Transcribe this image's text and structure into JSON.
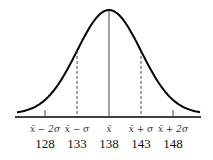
{
  "chart_data": {
    "type": "line",
    "title": "",
    "xlabel": "",
    "ylabel": "",
    "mean": 138,
    "sigma": 5,
    "x": [
      123,
      128,
      133,
      138,
      143,
      148,
      153
    ],
    "tick_symbols": [
      "x̄ − 2σ",
      "x̄ − σ",
      "x̄",
      "x̄ + σ",
      "x̄ + 2σ"
    ],
    "tick_values": [
      "128",
      "133",
      "138",
      "143",
      "148"
    ],
    "markers": [
      {
        "value": 128,
        "style": "tick"
      },
      {
        "value": 133,
        "style": "dashed"
      },
      {
        "value": 138,
        "style": "solid"
      },
      {
        "value": 143,
        "style": "dashed"
      },
      {
        "value": 148,
        "style": "tick"
      }
    ],
    "grid": false,
    "legend": null
  },
  "colors": {
    "curve": "#000000",
    "axis": "#000000",
    "lines": "#444444"
  }
}
